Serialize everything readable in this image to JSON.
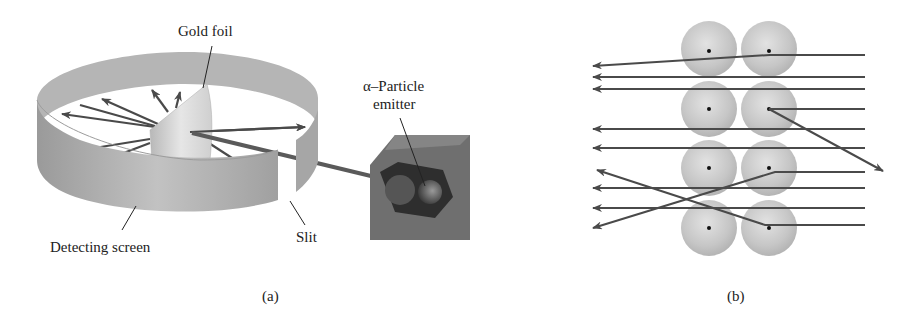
{
  "panel_a": {
    "caption": "(a)",
    "labels": {
      "gold_foil": "Gold foil",
      "emitter_line1": "α–Particle",
      "emitter_line2": "emitter",
      "detecting_screen": "Detecting screen",
      "slit": "Slit"
    }
  },
  "panel_b": {
    "caption": "(b)",
    "atom_grid": {
      "rows": 4,
      "cols": 2
    },
    "description": "Alpha particles passing through a lattice of gold atoms; most pass straight through, a few are deflected or bounced back by nuclei"
  },
  "colors": {
    "screen": "#a9a9a9",
    "arrow": "#4a4a4a",
    "atom": "#c4c4c4",
    "emitter_box": "#6a6a6a"
  }
}
